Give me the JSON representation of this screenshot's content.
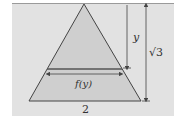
{
  "figure": {
    "type": "equilateral-triangle-cross-section",
    "labels": {
      "height_segment": "y",
      "total_height": "√3",
      "cross_section_width": "f(y)",
      "base": "2"
    },
    "colors": {
      "background": "#e2e2e2",
      "triangle_fill": "#cfcfcf",
      "line": "#444444"
    }
  }
}
